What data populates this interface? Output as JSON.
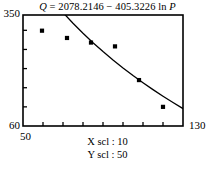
{
  "title": {
    "full": "Q = 2078.2146 − 405.3226 ln P",
    "response_var": "Q",
    "equals": " = ",
    "intercept": "2078.2146",
    "operator": " − ",
    "slope": "405.3226",
    "log_fn": " ln ",
    "predictor_var": "P"
  },
  "axes": {
    "y_max_label": "350",
    "y_min_label": "60",
    "x_min_label": "50",
    "x_max_label": "130",
    "x_scale_note": "X scl : 10",
    "y_scale_note": "Y scl : 50"
  },
  "colors": {
    "frame": "#000000",
    "curve": "#000000",
    "marker": "#000000",
    "background": "#ffffff"
  },
  "chart_data": {
    "type": "scatter",
    "title": "Q = 2078.2146 − 405.3226 ln P",
    "xlabel": "P",
    "ylabel": "Q",
    "xlim": [
      50,
      130
    ],
    "ylim": [
      60,
      350
    ],
    "x_tick_step": 10,
    "y_tick_step": 50,
    "grid": false,
    "legend": false,
    "x_ticks": [
      50,
      60,
      70,
      80,
      90,
      100,
      110,
      120,
      130
    ],
    "y_ticks": [
      60,
      110,
      160,
      210,
      260,
      310
    ],
    "series": [
      {
        "name": "Observed data",
        "type": "scatter",
        "marker": "square",
        "x": [
          59.5,
          72,
          84,
          96,
          108,
          120
        ],
        "y": [
          309,
          290,
          278,
          268,
          180,
          110
        ]
      },
      {
        "name": "Q = 2078.2146 − 405.3226 ln P",
        "type": "line",
        "model": "logarithmic",
        "intercept": 2078.2146,
        "slope": -405.3226,
        "x": [
          55,
          60,
          65,
          70,
          75,
          80,
          85,
          90,
          95,
          100,
          105,
          110,
          115,
          120,
          125,
          130
        ],
        "y": [
          454.2,
          419.0,
          386.5,
          356.4,
          328.4,
          302.2,
          277.6,
          254.4,
          232.5,
          211.7,
          191.9,
          173.1,
          155.1,
          137.9,
          121.3,
          105.4
        ]
      }
    ],
    "annotations": [
      "X scl : 10",
      "Y scl : 50"
    ]
  }
}
